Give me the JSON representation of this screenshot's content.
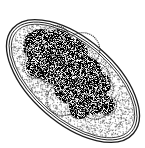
{
  "illustration": {
    "subject": "parasite egg (stippled drawing)",
    "colors": {
      "ink": "#1a1a1a",
      "paper": "#ffffff",
      "stipple": "#333333"
    }
  }
}
